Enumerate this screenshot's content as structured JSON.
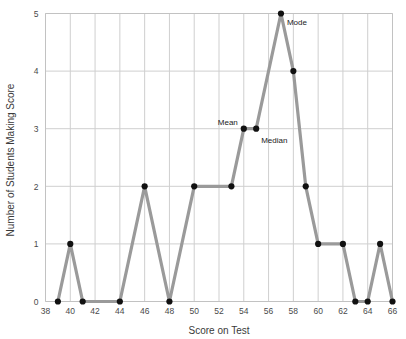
{
  "chart_data": {
    "type": "line",
    "title": "",
    "xlabel": "Score on Test",
    "ylabel": "Number of Students Making Score",
    "xlim": [
      38,
      66
    ],
    "ylim": [
      0,
      5
    ],
    "grid": true,
    "legend": "none",
    "xticks": [
      38,
      40,
      42,
      44,
      46,
      48,
      50,
      52,
      54,
      56,
      58,
      60,
      62,
      64,
      66
    ],
    "yticks": [
      0,
      1,
      2,
      3,
      4,
      5
    ],
    "x": [
      39,
      40,
      41,
      44,
      46,
      48,
      50,
      53,
      54,
      55,
      57,
      58,
      59,
      60,
      62,
      63,
      64,
      65,
      66
    ],
    "values": [
      0,
      1,
      0,
      0,
      2,
      0,
      2,
      2,
      3,
      3,
      5,
      4,
      2,
      1,
      1,
      0,
      0,
      1,
      0
    ],
    "series": [
      {
        "name": "Number of Students Making Score",
        "values": [
          0,
          1,
          0,
          0,
          2,
          0,
          2,
          2,
          3,
          3,
          5,
          4,
          2,
          1,
          1,
          0,
          0,
          1,
          0
        ]
      }
    ],
    "line_color": "#9a9a9a",
    "marker_color": "#111111",
    "grid_color": "#cfcfcf",
    "annotations": [
      {
        "label": "Mean",
        "x": 54,
        "y": 3,
        "anchor": "end",
        "dx": -6,
        "dy": -4
      },
      {
        "label": "Median",
        "x": 55,
        "y": 3,
        "anchor": "start",
        "dx": 5,
        "dy": 14
      },
      {
        "label": "Mode",
        "x": 57,
        "y": 5,
        "anchor": "start",
        "dx": 6,
        "dy": 11
      }
    ]
  }
}
